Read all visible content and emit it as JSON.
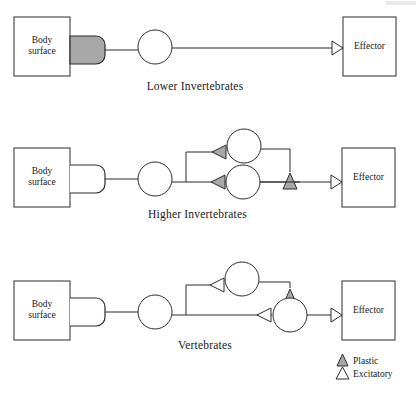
{
  "figure": {
    "type": "neural-circuit-diagram",
    "stroke_color": "#2b2b2b",
    "plastic_fill": "#a8a8a8",
    "excitatory_fill": "#ffffff",
    "receptor_filled_fill": "#a8a8a8",
    "background": "#ffffff"
  },
  "rows": [
    {
      "id": "lower-invertebrates",
      "caption": "Lower Invertebrates",
      "source_label": "Body\nsurface",
      "target_label": "Effector",
      "receptor_style": "plastic",
      "interneuron_count": 1,
      "synapses": [
        {
          "name": "effector-synapse",
          "type": "excitatory"
        }
      ]
    },
    {
      "id": "higher-invertebrates",
      "caption": "Higher Invertebrates",
      "source_label": "Body\nsurface",
      "target_label": "Effector",
      "receptor_style": "excitatory",
      "interneuron_count": 3,
      "synapses": [
        {
          "name": "upper-interneuron-input",
          "type": "plastic"
        },
        {
          "name": "lower-interneuron-input",
          "type": "plastic"
        },
        {
          "name": "upper-to-lower-path",
          "type": "plastic"
        },
        {
          "name": "effector-synapse",
          "type": "excitatory"
        }
      ]
    },
    {
      "id": "vertebrates",
      "caption": "Vertebrates",
      "source_label": "Body\nsurface",
      "target_label": "Effector",
      "receptor_style": "excitatory",
      "interneuron_count": 3,
      "synapses": [
        {
          "name": "upper-interneuron-input",
          "type": "excitatory"
        },
        {
          "name": "lower-interneuron-input",
          "type": "excitatory"
        },
        {
          "name": "upper-to-lower-path",
          "type": "plastic"
        },
        {
          "name": "effector-synapse",
          "type": "excitatory"
        }
      ]
    }
  ],
  "legend": {
    "items": [
      {
        "key": "plastic",
        "label": "Plastic",
        "fill": "#a8a8a8"
      },
      {
        "key": "excitatory",
        "label": "Excitatory",
        "fill": "#ffffff"
      }
    ]
  }
}
